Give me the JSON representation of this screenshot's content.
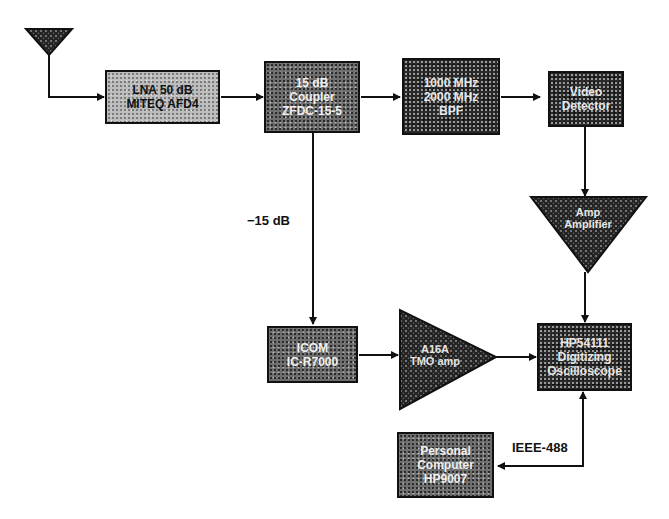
{
  "diagram": {
    "type": "rf-measurement-block-diagram",
    "antenna": {
      "label": ""
    },
    "blocks": [
      {
        "id": "lna",
        "lines": [
          "LNA 50 dB",
          "MITEQ AFD4"
        ]
      },
      {
        "id": "coupler",
        "lines": [
          "15 dB",
          "Coupler",
          "ZFDC-15-5"
        ]
      },
      {
        "id": "bpf",
        "lines": [
          "1000 MHz",
          "2000 MHz",
          "BPF"
        ]
      },
      {
        "id": "video-detector",
        "lines": [
          "Video",
          "Detector"
        ]
      },
      {
        "id": "amplifier",
        "lines": [
          "Amp",
          "Amplifier"
        ]
      },
      {
        "id": "icom-receiver",
        "lines": [
          "ICOM",
          "IC-R7000"
        ]
      },
      {
        "id": "if-amplifier",
        "lines": [
          "A16A",
          "TMO amp"
        ]
      },
      {
        "id": "digitizing-oscilloscope",
        "lines": [
          "HP54111",
          "Digitizing",
          "Oscilloscope"
        ]
      },
      {
        "id": "personal-computer",
        "lines": [
          "Personal",
          "Computer",
          "HP9007"
        ]
      }
    ],
    "annotations": {
      "coupled_port": "−15 dB",
      "bus": "IEEE-488"
    },
    "colors": {
      "line": "#111111",
      "background": "#ffffff"
    }
  }
}
